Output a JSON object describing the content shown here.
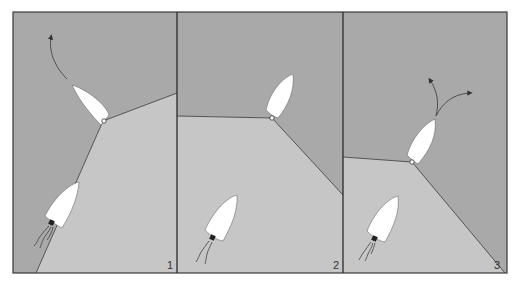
{
  "figure": {
    "colors": {
      "water_dark": "#a9a9a9",
      "water_light": "#c6c6c6",
      "boat_fill": "#ffffff",
      "line": "#4a4a4a",
      "frame": "#3a3a3a",
      "engine": "#222222"
    },
    "panels": [
      {
        "label": "1"
      },
      {
        "label": "2"
      },
      {
        "label": "3"
      }
    ]
  }
}
